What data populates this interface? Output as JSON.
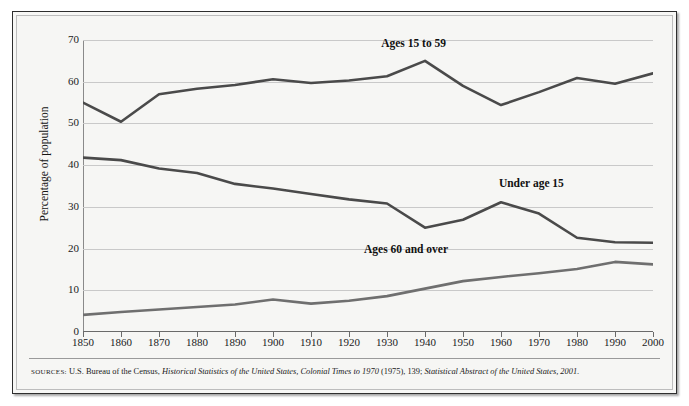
{
  "figure": {
    "y_axis_title": "Percentage of population",
    "source_prefix": "SOURCES:",
    "source_part1": "U.S. Bureau of the Census,",
    "source_italic1": "Historical Statistics of the United States, Colonial Times to 1970",
    "source_part2": "(1975), 139;",
    "source_italic2": "Statistical Abstract of the United States, 2001",
    "source_end": "."
  },
  "chart_data": {
    "type": "line",
    "title": "",
    "subtitle": "",
    "xlabel": "",
    "ylabel": "Percentage of population",
    "xlim": [
      1850,
      2000
    ],
    "ylim": [
      0,
      70
    ],
    "ytick_interval": 10,
    "grid": true,
    "legend_position": "inline-annotations",
    "x": [
      1850,
      1860,
      1870,
      1880,
      1890,
      1900,
      1910,
      1920,
      1930,
      1940,
      1950,
      1960,
      1970,
      1980,
      1990,
      2000
    ],
    "xticklabels": [
      "1850",
      "1860",
      "1870",
      "1880",
      "1890",
      "1900",
      "1910",
      "1920",
      "1930",
      "1940",
      "1950",
      "1960",
      "1970",
      "1980",
      "1990",
      "2000"
    ],
    "yticklabels": [
      "0",
      "10",
      "20",
      "30",
      "40",
      "50",
      "60",
      "70"
    ],
    "yticks": [
      0,
      10,
      20,
      30,
      40,
      50,
      60,
      70
    ],
    "series": [
      {
        "name": "Ages 15 to 59",
        "color": "#4a4a4a",
        "label_x": 1937,
        "label_y": 69.0,
        "values": [
          55.0,
          50.4,
          57.0,
          58.3,
          59.2,
          60.6,
          59.7,
          60.3,
          61.3,
          65.0,
          59.0,
          54.4,
          57.5,
          60.9,
          59.5,
          62.0
        ]
      },
      {
        "name": "Under age 15",
        "color": "#4a4a4a",
        "label_x": 1968,
        "label_y": 35.4,
        "values": [
          41.8,
          41.2,
          39.2,
          38.1,
          35.5,
          34.4,
          33.1,
          31.8,
          30.8,
          25.0,
          26.9,
          31.1,
          28.4,
          22.6,
          21.5,
          21.4
        ]
      },
      {
        "name": "Ages 60 and over",
        "color": "#6f6f6f",
        "label_x": 1935,
        "label_y": 19.6,
        "values": [
          4.1,
          4.8,
          5.4,
          6.0,
          6.6,
          7.8,
          6.8,
          7.5,
          8.6,
          10.4,
          12.2,
          13.2,
          14.1,
          15.1,
          16.8,
          16.2
        ]
      }
    ]
  }
}
